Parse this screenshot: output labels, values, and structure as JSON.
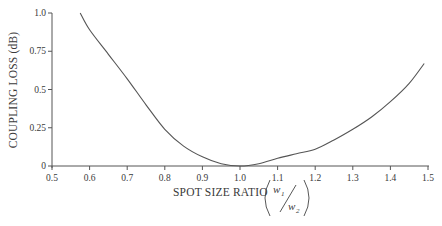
{
  "chart_data": {
    "type": "line",
    "title": "",
    "xlabel": "SPOT SIZE RATIO",
    "xlabel_fraction": {
      "numerator": "w",
      "numerator_sub": "1",
      "denominator": "w",
      "denominator_sub": "2"
    },
    "ylabel": "COUPLING LOSS (dB)",
    "xlim": [
      0.5,
      1.5
    ],
    "ylim": [
      0,
      1.0
    ],
    "grid": false,
    "legend": null,
    "x_ticks": [
      "0.5",
      "0.6",
      "0.7",
      "0.8",
      "0.9",
      "1.0",
      "1.1",
      "1.2",
      "1.3",
      "1.4",
      "1.5"
    ],
    "y_ticks": [
      "0",
      "0.25",
      "0.5",
      "0.75",
      "1.0"
    ],
    "series": [
      {
        "name": "Coupling loss",
        "x": [
          0.575,
          0.6,
          0.65,
          0.7,
          0.75,
          0.8,
          0.85,
          0.9,
          0.95,
          1.0,
          1.05,
          1.1,
          1.15,
          1.2,
          1.25,
          1.3,
          1.35,
          1.4,
          1.45,
          1.49
        ],
        "y": [
          1.0,
          0.89,
          0.73,
          0.57,
          0.4,
          0.24,
          0.13,
          0.06,
          0.015,
          0.0,
          0.015,
          0.05,
          0.08,
          0.11,
          0.17,
          0.24,
          0.32,
          0.42,
          0.54,
          0.67
        ]
      }
    ]
  },
  "labels": {
    "ylabel": "COUPLING LOSS (dB)",
    "xlabel": "SPOT SIZE RATIO",
    "frac_num": "w",
    "frac_num_sub": "1",
    "frac_den": "w",
    "frac_den_sub": "2"
  },
  "colors": {
    "axis": "#555555",
    "curve": "#555555",
    "text": "#3a3a3a"
  }
}
